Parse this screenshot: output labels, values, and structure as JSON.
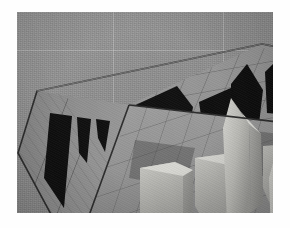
{
  "page": {
    "background_color": "#ffffff",
    "photo": {
      "x": 17,
      "y": 12,
      "width": 256,
      "height": 201,
      "medium": "grayscale photograph",
      "subject": "architectural scale model",
      "backdrop_color": "#8f8f8f",
      "caption": ""
    }
  },
  "scene": {
    "name": "tilted grid-tiled diorama model",
    "description": "An open rectangular box-like architectural model seen from above at an angle. The floor and the two standing back walls are ruled into a square tile grid. Black angular zig-zag silhouettes are cut into or painted on the walls, and several pale pointed tower forms rise from the floor.",
    "colors": {
      "floor_tile": "#8a8a8a",
      "floor_tile_light": "#9c9c9c",
      "wall_left": "#8e8e8e",
      "wall_back": "#949494",
      "grid_line": "#4a4a4a",
      "rim_edge": "#2e2e2e",
      "dark_cutout": "#0d0d0d",
      "tower_light": "#c9c9c4",
      "tower_mid": "#b0b0ab",
      "tower_shadow": "#8b8b88",
      "cast_shadow": "#5d5d5d"
    },
    "elements": [
      {
        "id": "floor-plane",
        "label": "grid-tiled floor plane"
      },
      {
        "id": "left-wall",
        "label": "left standing wall with grid"
      },
      {
        "id": "back-wall",
        "label": "back standing wall with grid"
      },
      {
        "id": "dark-zigzag-left",
        "label": "black zig-zag silhouette on left wall"
      },
      {
        "id": "dark-zigzag-back",
        "label": "black angular silhouette on back wall"
      },
      {
        "id": "tower-tall-center",
        "label": "tall pointed tower, center"
      },
      {
        "id": "tower-tall-front",
        "label": "tall pointed tower, front"
      },
      {
        "id": "tower-block-left",
        "label": "low stepped block, left"
      },
      {
        "id": "tower-block-right",
        "label": "low stepped block, right"
      },
      {
        "id": "triangle-marker",
        "label": "small dark triangle marker on back wall"
      }
    ],
    "grid": {
      "floor_columns": 8,
      "floor_rows": 6,
      "wall_columns": 9,
      "wall_rows": 4
    }
  }
}
